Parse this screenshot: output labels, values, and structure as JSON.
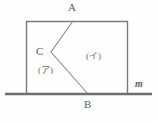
{
  "figure": {
    "background_color": "#fefefe",
    "stroke_color": "#7a7a7a",
    "baseline_color": "#6e6e6e",
    "label_color": "#5d5d5d",
    "labels": {
      "point_a": "A",
      "point_c": "C",
      "point_b": "B",
      "region_left": "(ア)",
      "region_right": "(イ)",
      "line_m": "m"
    },
    "geometry": {
      "rectangle": {
        "left": 26,
        "right": 128,
        "top": 21,
        "bottom": 94
      },
      "baseline": {
        "y": 94,
        "x_start": 5,
        "x_end": 152
      },
      "points": {
        "A": [
          73,
          21
        ],
        "C": [
          51,
          52
        ],
        "B": [
          88,
          94
        ]
      },
      "polyline": "A-C-B"
    }
  }
}
